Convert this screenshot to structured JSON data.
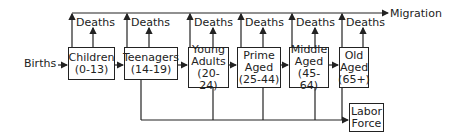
{
  "diagram": {
    "input_label": "Births",
    "output_top_label": "Migration",
    "death_label": "Deaths",
    "stages": [
      {
        "id": "children",
        "lines": [
          "Children",
          "(0-13)"
        ]
      },
      {
        "id": "teenagers",
        "lines": [
          "Teenagers",
          "(14-19)"
        ]
      },
      {
        "id": "young-adults",
        "lines": [
          "Young",
          "Adults",
          "(20-24)"
        ]
      },
      {
        "id": "prime-aged",
        "lines": [
          "Prime",
          "Aged",
          "(25-44)"
        ]
      },
      {
        "id": "middle-aged",
        "lines": [
          "Middle",
          "Aged",
          "(45-64)"
        ]
      },
      {
        "id": "old-aged",
        "lines": [
          "Old",
          "Aged",
          "(65+)"
        ]
      }
    ],
    "sink": {
      "id": "labor-force",
      "lines": [
        "Labor",
        "Force"
      ]
    },
    "deaths_labels": [
      "Deaths",
      "Deaths",
      "Deaths",
      "Deaths",
      "Deaths",
      "Deaths"
    ]
  }
}
